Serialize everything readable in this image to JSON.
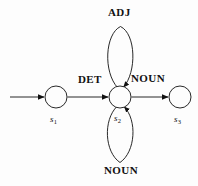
{
  "diagram": {
    "background_color": "#fdfdfd",
    "stroke_color": "#111111",
    "states": [
      {
        "id": "s1",
        "label": "s",
        "subscript": "1",
        "cx": 56,
        "cy": 97,
        "r": 11
      },
      {
        "id": "s2",
        "label": "s",
        "subscript": "2",
        "cx": 120,
        "cy": 97,
        "r": 11
      },
      {
        "id": "s3",
        "label": "s",
        "subscript": "3",
        "cx": 180,
        "cy": 97,
        "r": 11
      }
    ],
    "transitions": [
      {
        "id": "start",
        "from": "",
        "to": "s1",
        "label": ""
      },
      {
        "id": "s1-s2",
        "from": "s1",
        "to": "s2",
        "label": "DET"
      },
      {
        "id": "s2-s3",
        "from": "s2",
        "to": "s3",
        "label": "NOUN"
      },
      {
        "id": "s2-loop-up",
        "from": "s2",
        "to": "s2",
        "label": "ADJ"
      },
      {
        "id": "s2-loop-dn",
        "from": "s2",
        "to": "s2",
        "label": "NOUN"
      }
    ],
    "labels": {
      "adj": "ADJ",
      "det": "DET",
      "noun_right": "NOUN",
      "noun_bottom": "NOUN",
      "s1": "s",
      "s1_sub": "1",
      "s2": "s",
      "s2_sub": "2",
      "s3": "s",
      "s3_sub": "3"
    }
  }
}
